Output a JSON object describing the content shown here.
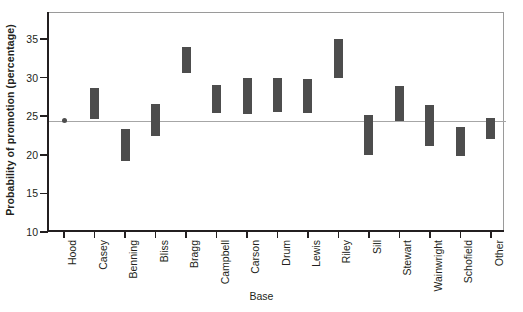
{
  "chart_data": {
    "type": "bar",
    "title": "",
    "subtitle": "",
    "xlabel": "Base",
    "ylabel": "Probability of promotion (percentage)",
    "ylim": [
      10,
      38.5
    ],
    "yticks": [
      10,
      15,
      20,
      25,
      30,
      35
    ],
    "ytick_labels": [
      "10",
      "15",
      "20",
      "25",
      "30",
      "35"
    ],
    "grid": false,
    "legend": null,
    "bar_style": "floating range bar (confidence interval)",
    "reference_line": {
      "value": 24.4,
      "label": "",
      "color": "#a6a6a6"
    },
    "bar_color": "#4d4d4d",
    "categories": [
      "Hood",
      "Casey",
      "Benning",
      "Bliss",
      "Bragg",
      "Campbell",
      "Carson",
      "Drum",
      "Lewis",
      "Riley",
      "Sill",
      "Stewart",
      "Wainwright",
      "Schofield",
      "Other"
    ],
    "series": [
      {
        "name": "lower",
        "values": [
          24.4,
          24.6,
          19.2,
          22.5,
          30.6,
          25.4,
          25.3,
          25.6,
          25.4,
          30.0,
          20.0,
          24.4,
          21.2,
          19.8,
          22.0
        ]
      },
      {
        "name": "upper",
        "values": [
          24.4,
          28.7,
          23.4,
          26.6,
          34.0,
          29.1,
          29.9,
          29.9,
          29.8,
          35.0,
          25.2,
          28.9,
          26.4,
          23.6,
          24.8
        ]
      }
    ],
    "points": [
      {
        "category": "Hood",
        "value": 24.4,
        "marker": "dot",
        "note": "reference base shown as single point"
      }
    ]
  },
  "axes": {
    "y_title": "Probability of promotion (percentage)",
    "x_title": "Base"
  }
}
